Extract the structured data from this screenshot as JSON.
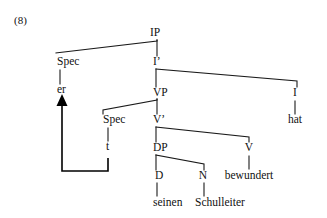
{
  "figure": {
    "example_number": "(8)",
    "caption": "",
    "colors": {
      "ink": "#111111",
      "line": "#1a1a1a",
      "background": "#ffffff",
      "movement_arrow": "#000000"
    }
  },
  "tree": {
    "type": "syntax-tree",
    "nodes": [
      {
        "id": "IP",
        "label": "IP",
        "x": 155,
        "y": 37,
        "align": "center",
        "kind": "phrase"
      },
      {
        "id": "Spec_IP",
        "label": "Spec",
        "x": 57,
        "y": 66,
        "align": "left",
        "kind": "specifier"
      },
      {
        "id": "er",
        "label": "er",
        "x": 57,
        "y": 94,
        "align": "left",
        "kind": "terminal"
      },
      {
        "id": "Ibar",
        "label": "I’",
        "x": 153,
        "y": 66,
        "align": "left",
        "kind": "bar-level"
      },
      {
        "id": "VP",
        "label": "VP",
        "x": 153,
        "y": 97,
        "align": "left",
        "kind": "phrase"
      },
      {
        "id": "I",
        "label": "I",
        "x": 295,
        "y": 97,
        "align": "center",
        "kind": "head"
      },
      {
        "id": "hat",
        "label": "hat",
        "x": 295,
        "y": 124,
        "align": "center",
        "kind": "terminal"
      },
      {
        "id": "Spec_VP",
        "label": "Spec",
        "x": 103,
        "y": 124,
        "align": "left",
        "kind": "specifier"
      },
      {
        "id": "t",
        "label": "t",
        "x": 106,
        "y": 151,
        "align": "left",
        "kind": "trace"
      },
      {
        "id": "Vbar",
        "label": "V’",
        "x": 153,
        "y": 124,
        "align": "left",
        "kind": "bar-level"
      },
      {
        "id": "DP",
        "label": "DP",
        "x": 153,
        "y": 152,
        "align": "left",
        "kind": "phrase"
      },
      {
        "id": "V",
        "label": "V",
        "x": 249,
        "y": 152,
        "align": "center",
        "kind": "head"
      },
      {
        "id": "bewundert",
        "label": "bewundert",
        "x": 249,
        "y": 180,
        "align": "center",
        "kind": "terminal"
      },
      {
        "id": "D",
        "label": "D",
        "x": 155,
        "y": 180,
        "align": "left",
        "kind": "head"
      },
      {
        "id": "N",
        "label": "N",
        "x": 203,
        "y": 180,
        "align": "center",
        "kind": "head"
      },
      {
        "id": "seinen",
        "label": "seinen",
        "x": 153,
        "y": 207,
        "align": "left",
        "kind": "terminal"
      },
      {
        "id": "Schulleiter",
        "label": "Schulleiter",
        "x": 220,
        "y": 207,
        "align": "center",
        "kind": "terminal"
      }
    ],
    "branches": [
      {
        "from": "IP",
        "to": "Spec_IP",
        "path": "M 157 40 L 157 41 L 56 53"
      },
      {
        "from": "IP",
        "to": "Ibar",
        "path": "M 157 40 L 157 56"
      },
      {
        "from": "Spec_IP",
        "to": "er",
        "path": "M 60 70 L 60 84"
      },
      {
        "from": "Ibar",
        "to": "VP",
        "path": "M 156 69 L 156 87"
      },
      {
        "from": "Ibar",
        "to": "I",
        "path": "M 156 69 L 297 81 L 297 87"
      },
      {
        "from": "I",
        "to": "hat",
        "path": "M 295 101 L 295 114"
      },
      {
        "from": "VP",
        "to": "Spec_VP",
        "path": "M 157 99 L 157 100 L 103 110 L 103 114"
      },
      {
        "from": "VP",
        "to": "Vbar",
        "path": "M 157 99 L 157 114"
      },
      {
        "from": "Spec_VP",
        "to": "t",
        "path": "M 108 128 L 108 141"
      },
      {
        "from": "Vbar",
        "to": "DP",
        "path": "M 156 127 L 156 142"
      },
      {
        "from": "Vbar",
        "to": "V",
        "path": "M 156 127 L 249 137 L 249 142"
      },
      {
        "from": "DP",
        "to": "D",
        "path": "M 156 155 L 156 170"
      },
      {
        "from": "DP",
        "to": "N",
        "path": "M 156 155 L 204 164 L 204 170"
      },
      {
        "from": "D",
        "to": "seinen",
        "path": "M 157 183 L 157 196"
      },
      {
        "from": "N",
        "to": "Schulleiter",
        "path": "M 204 183 L 204 196"
      },
      {
        "from": "V",
        "to": "bewundert",
        "path": "M 249 156 L 249 169"
      }
    ],
    "movement": {
      "label": "movement-arrow",
      "from_node": "t",
      "to_node": "er",
      "path": "M 108 158 L 108 171 L 62 171 L 62 100",
      "arrowhead": {
        "x": 62,
        "y": 94,
        "width": 11,
        "height": 12
      }
    }
  }
}
